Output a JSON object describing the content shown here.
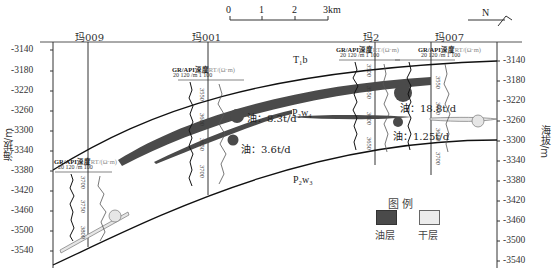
{
  "scale_bar": {
    "ticks": [
      "0",
      "1",
      "2",
      "3km"
    ],
    "north_label": "N"
  },
  "y_axis": {
    "title": "海拔/m",
    "ticks": [
      "-3140",
      "-3180",
      "-3220",
      "-3260",
      "-3300",
      "-3340",
      "-3380",
      "-3420",
      "-3460",
      "-3500",
      "-3540"
    ]
  },
  "wells": [
    {
      "name": "玛009",
      "depths": [
        "3700",
        "3750",
        "3800"
      ]
    },
    {
      "name": "玛001",
      "depths": [
        "3550",
        "3600",
        "3650",
        "3700"
      ]
    },
    {
      "name": "玛2",
      "depths": [
        "3500",
        "3550",
        "3600",
        "3650"
      ]
    },
    {
      "name": "玛007",
      "depths": [
        "3550",
        "3600",
        "3650",
        "3700"
      ]
    }
  ],
  "log_header": {
    "gr": "GR/API",
    "depth": "深度",
    "rt": "RT/(Ω·m)",
    "gr_scale_min": "20",
    "gr_scale_max": "120",
    "depth_unit": "/m",
    "rt_scale_min": "1",
    "rt_scale_max": "100"
  },
  "formations": {
    "top": "T₁b",
    "upper": "P₂w₄",
    "lower": "P₂w₃"
  },
  "oil_labels": [
    {
      "text": "油：8.3t/d"
    },
    {
      "text": "油：3.6t/d"
    },
    {
      "text": "油：18.8t/d"
    },
    {
      "text": "油：1.25t/d"
    }
  ],
  "legend": {
    "title": "图  例",
    "items": [
      {
        "label": "油层",
        "color": "#4a4a4a"
      },
      {
        "label": "干层",
        "color": "#ececec"
      }
    ]
  },
  "colors": {
    "oil_layer": "#4a4a4a",
    "dry_layer": "#ececec",
    "line": "#111111"
  }
}
